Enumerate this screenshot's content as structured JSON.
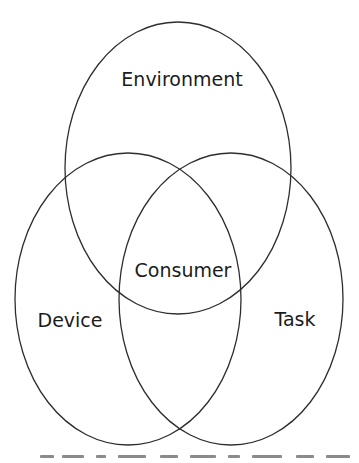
{
  "diagram": {
    "type": "venn",
    "sets": [
      {
        "id": "environment",
        "label": "Environment",
        "cx": 178,
        "cy": 168,
        "rx": 113,
        "ry": 146,
        "label_x": 182,
        "label_y": 86
      },
      {
        "id": "device",
        "label": "Device",
        "cx": 128,
        "cy": 299,
        "rx": 113,
        "ry": 146,
        "label_x": 70,
        "label_y": 327
      },
      {
        "id": "task",
        "label": "Task",
        "cx": 231,
        "cy": 299,
        "rx": 112,
        "ry": 146,
        "label_x": 295,
        "label_y": 326
      }
    ],
    "intersection": {
      "label": "Consumer",
      "label_x": 183,
      "label_y": 277
    },
    "stroke_color": "#2e2e2e",
    "text_color": "#1c1c1c",
    "background": "#ffffff"
  }
}
